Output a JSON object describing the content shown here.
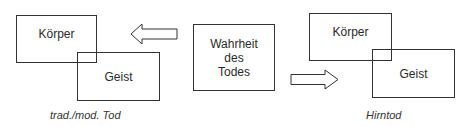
{
  "left_group": {
    "body_label": "Körper",
    "mind_label": "Geist",
    "caption": "trad./mod. Tod"
  },
  "center": {
    "lines": [
      "Wahrheit",
      "des",
      "Todes"
    ]
  },
  "right_group": {
    "body_label": "Körper",
    "mind_label": "Geist",
    "caption": "Hirntod"
  },
  "arrows": {
    "left": "arrow-left",
    "right": "arrow-right"
  }
}
